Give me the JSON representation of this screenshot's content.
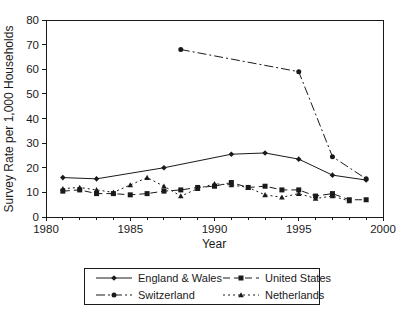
{
  "figure": {
    "background": "#ffffff",
    "ink_color": "#1a1a1a"
  },
  "chart_data": {
    "type": "line",
    "title": "",
    "xlabel": "Year",
    "ylabel": "Survey Rate per 1,000 Households",
    "xlim": [
      1980,
      2000
    ],
    "ylim": [
      0,
      80
    ],
    "x_major_ticks": [
      1980,
      1985,
      1990,
      1995,
      2000
    ],
    "x_minor_tick_interval": 1,
    "y_ticks": [
      0,
      10,
      20,
      30,
      40,
      50,
      60,
      70,
      80
    ],
    "grid": false,
    "legend_position": "bottom",
    "series": [
      {
        "name": "England & Wales",
        "marker": "diamond",
        "line_style": "solid",
        "color": "#1a1a1a",
        "points": [
          [
            1981,
            16
          ],
          [
            1983,
            15.5
          ],
          [
            1987,
            20
          ],
          [
            1991,
            25.5
          ],
          [
            1993,
            26
          ],
          [
            1995,
            23.5
          ],
          [
            1997,
            17
          ],
          [
            1999,
            15
          ]
        ]
      },
      {
        "name": "United States",
        "marker": "square",
        "line_style": "dashed",
        "color": "#1a1a1a",
        "points": [
          [
            1981,
            10.5
          ],
          [
            1982,
            11
          ],
          [
            1983,
            9.5
          ],
          [
            1984,
            9.5
          ],
          [
            1985,
            9
          ],
          [
            1986,
            9.5
          ],
          [
            1987,
            10.5
          ],
          [
            1988,
            11
          ],
          [
            1989,
            12
          ],
          [
            1990,
            12.5
          ],
          [
            1991,
            14
          ],
          [
            1992,
            12
          ],
          [
            1993,
            12.5
          ],
          [
            1994,
            11
          ],
          [
            1995,
            11
          ],
          [
            1996,
            8.5
          ],
          [
            1997,
            9.5
          ],
          [
            1998,
            7
          ],
          [
            1999,
            7
          ]
        ]
      },
      {
        "name": "Switzerland",
        "marker": "circle",
        "line_style": "dashdot",
        "color": "#1a1a1a",
        "points": [
          [
            1988,
            68
          ],
          [
            1995,
            59
          ],
          [
            1997,
            24.5
          ],
          [
            1999,
            15.5
          ]
        ]
      },
      {
        "name": "Netherlands",
        "marker": "triangle",
        "line_style": "dotted",
        "color": "#1a1a1a",
        "points": [
          [
            1981,
            11.5
          ],
          [
            1982,
            12
          ],
          [
            1983,
            11
          ],
          [
            1984,
            10
          ],
          [
            1985,
            13
          ],
          [
            1986,
            16
          ],
          [
            1987,
            12.5
          ],
          [
            1988,
            8.5
          ],
          [
            1989,
            11.5
          ],
          [
            1990,
            13.5
          ],
          [
            1991,
            13
          ],
          [
            1992,
            12
          ],
          [
            1993,
            9
          ],
          [
            1994,
            8
          ],
          [
            1995,
            9.5
          ],
          [
            1996,
            7.5
          ],
          [
            1997,
            8.5
          ],
          [
            1998,
            6.5
          ]
        ]
      }
    ]
  }
}
